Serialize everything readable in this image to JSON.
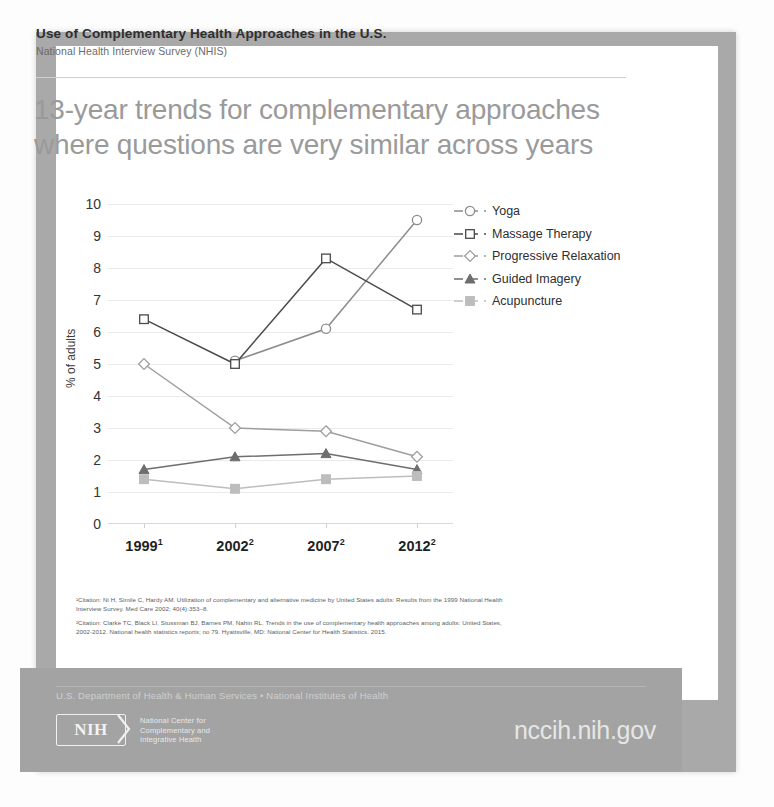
{
  "header": {
    "title": "Use of Complementary Health Approaches in the U.S.",
    "subtitle": "National Health Interview Survey (NHIS)"
  },
  "headline": "13-year trends for complementary approaches where questions are very similar across years",
  "chart_data": {
    "type": "line",
    "title": "13-year trends for complementary approaches where questions are very similar across years",
    "xlabel": "",
    "ylabel": "% of adults",
    "categories": [
      "1999",
      "2002",
      "2007",
      "2012"
    ],
    "category_footnote_marks": [
      "1",
      "2",
      "2",
      "2"
    ],
    "yticks": [
      0,
      1,
      2,
      3,
      4,
      5,
      6,
      7,
      8,
      9,
      10
    ],
    "ylim": [
      0,
      10
    ],
    "grid": true,
    "legend_position": "right",
    "series": [
      {
        "name": "Yoga",
        "marker": "circle",
        "color": "#8c8c8c",
        "values": [
          null,
          5.1,
          6.1,
          9.5
        ]
      },
      {
        "name": "Massage Therapy",
        "marker": "square",
        "color": "#4a4a4a",
        "values": [
          6.4,
          5.0,
          8.3,
          6.7
        ]
      },
      {
        "name": "Progressive Relaxation",
        "marker": "diamond",
        "color": "#9e9e9e",
        "values": [
          5.0,
          3.0,
          2.9,
          2.1
        ]
      },
      {
        "name": "Guided Imagery",
        "marker": "triangle",
        "color": "#6e6e6e",
        "values": [
          1.7,
          2.1,
          2.2,
          1.7
        ]
      },
      {
        "name": "Acupuncture",
        "marker": "square",
        "color": "#bdbdbd",
        "values": [
          1.4,
          1.1,
          1.4,
          1.5
        ]
      }
    ]
  },
  "legend": [
    {
      "label": "Yoga"
    },
    {
      "label": "Massage Therapy"
    },
    {
      "label": "Progressive Relaxation"
    },
    {
      "label": "Guided Imagery"
    },
    {
      "label": "Acupuncture"
    }
  ],
  "footnotes": [
    "¹Citation: Ni H, Simile C, Hardy AM. Utilization of complementary and alternative medicine by United States adults: Results from the 1999 National Health Interview Survey. Med Care 2002; 40(4):353–8.",
    "²Citation: Clarke TC, Black LI, Stussman BJ, Barnes PM, Nahin RL. Trends in the use of complementary health approaches among adults: United States, 2002-2012. National health statistics reports; no 79. Hyattsville, MD: National Center for Health Statistics. 2015."
  ],
  "footer": {
    "department": "U.S. Department of Health & Human Services • National Institutes of Health",
    "logo_text": "NIH",
    "center_name": "National Center for\nComplementary and\nIntegrative Health",
    "url": "nccih.nih.gov"
  }
}
